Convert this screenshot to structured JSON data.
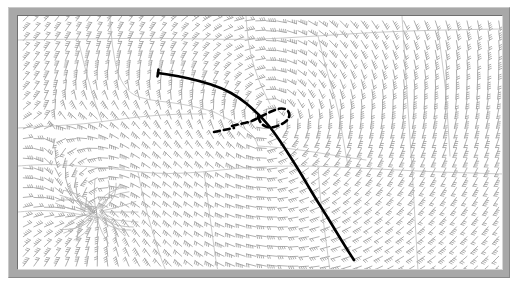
{
  "figure": {
    "title": "",
    "subtitle": "",
    "caption": "",
    "width_px": 518,
    "height_px": 296,
    "background_color": "#ffffff",
    "frame": {
      "name": "beveled-gray-frame",
      "outer_color": "#a8a8a8",
      "highlight_color": "#c9c9c9",
      "shadow_color": "#888888",
      "inner_border_color": "#6f6f6f",
      "plot_background": "#ffffff"
    }
  },
  "chart_data": {
    "type": "scatter",
    "title": "",
    "subtitle": "",
    "xlabel": "",
    "ylabel": "",
    "xlim": [
      0,
      486
    ],
    "ylim": [
      0,
      255
    ],
    "grid": false,
    "legend": "none",
    "annotations": [],
    "tick_labels": {
      "x": [],
      "y": []
    },
    "series": [
      {
        "name": "wind-barb-field",
        "kind": "vector-field",
        "symbol": "wind-barb",
        "color": "#9a9a9a",
        "grid_nx": 46,
        "grid_ny": 26,
        "barb_length_px": 9.5,
        "notes": "Light gray wind barbs on a regular lattice; direction rotates from westerly in the upper-left, through cyclonic turning around the central loop, to strong northerly/southerly flow on the right half."
      },
      {
        "name": "geographic-boundaries",
        "kind": "polyline-set",
        "color": "#b4b4b4",
        "width_px": 0.7,
        "polylines": [
          [
            [
              0,
              24
            ],
            [
              60,
              23
            ],
            [
              140,
              22
            ],
            [
              230,
              24
            ],
            [
              300,
              20
            ],
            [
              360,
              16
            ],
            [
              420,
              14
            ],
            [
              486,
              13
            ]
          ],
          [
            [
              92,
              0
            ],
            [
              94,
              30
            ],
            [
              100,
              60
            ],
            [
              112,
              78
            ],
            [
              130,
              84
            ],
            [
              150,
              86
            ],
            [
              175,
              90
            ],
            [
              196,
              96
            ]
          ],
          [
            [
              196,
              96
            ],
            [
              212,
              104
            ],
            [
              226,
              112
            ],
            [
              236,
              120
            ],
            [
              240,
              130
            ]
          ],
          [
            [
              0,
              112
            ],
            [
              34,
              110
            ],
            [
              66,
              108
            ],
            [
              96,
              104
            ],
            [
              128,
              100
            ],
            [
              160,
              98
            ],
            [
              188,
              98
            ]
          ],
          [
            [
              0,
              150
            ],
            [
              30,
              148
            ],
            [
              60,
              150
            ],
            [
              92,
              152
            ],
            [
              120,
              156
            ],
            [
              150,
              158
            ],
            [
              186,
              156
            ],
            [
              220,
              152
            ],
            [
              258,
              150
            ],
            [
              300,
              150
            ],
            [
              340,
              152
            ],
            [
              380,
              154
            ],
            [
              420,
              156
            ],
            [
              486,
              158
            ]
          ],
          [
            [
              120,
              156
            ],
            [
              126,
              186
            ],
            [
              134,
              214
            ],
            [
              142,
              240
            ],
            [
              148,
              255
            ]
          ],
          [
            [
              228,
              0
            ],
            [
              230,
              26
            ],
            [
              236,
              52
            ],
            [
              244,
              72
            ],
            [
              252,
              88
            ]
          ],
          [
            [
              300,
              20
            ],
            [
              306,
              44
            ],
            [
              312,
              66
            ],
            [
              318,
              86
            ],
            [
              322,
              104
            ],
            [
              326,
              128
            ],
            [
              330,
              150
            ]
          ],
          [
            [
              384,
              0
            ],
            [
              386,
              30
            ],
            [
              388,
              60
            ],
            [
              390,
              92
            ],
            [
              392,
              122
            ],
            [
              394,
              152
            ],
            [
              396,
              186
            ],
            [
              398,
              220
            ],
            [
              400,
              255
            ]
          ],
          [
            [
              300,
              150
            ],
            [
              302,
              180
            ],
            [
              306,
              210
            ],
            [
              310,
              240
            ],
            [
              312,
              255
            ]
          ],
          [
            [
              0,
              196
            ],
            [
              24,
              194
            ],
            [
              48,
              196
            ],
            [
              70,
              200
            ],
            [
              96,
              204
            ],
            [
              120,
              206
            ]
          ],
          [
            [
              240,
              130
            ],
            [
              268,
              132
            ],
            [
              296,
              136
            ],
            [
              320,
              140
            ],
            [
              348,
              144
            ]
          ],
          [
            [
              60,
              23
            ],
            [
              66,
              48
            ],
            [
              72,
              70
            ],
            [
              78,
              90
            ],
            [
              84,
              106
            ]
          ],
          [
            [
              420,
              14
            ],
            [
              424,
              44
            ],
            [
              428,
              76
            ],
            [
              430,
              108
            ],
            [
              432,
              140
            ]
          ],
          [
            [
              186,
              156
            ],
            [
              190,
              186
            ],
            [
              194,
              216
            ],
            [
              198,
              246
            ],
            [
              200,
              255
            ]
          ]
        ]
      },
      {
        "name": "primary-trough-axis",
        "kind": "curve",
        "style": "solid",
        "color": "#000000",
        "width_px": 2.6,
        "start_marker": "short-tick",
        "points": [
          [
            140,
            57
          ],
          [
            160,
            60
          ],
          [
            182,
            65
          ],
          [
            204,
            72
          ],
          [
            222,
            82
          ],
          [
            236,
            94
          ],
          [
            246,
            104
          ],
          [
            256,
            116
          ],
          [
            268,
            134
          ],
          [
            282,
            156
          ],
          [
            296,
            180
          ],
          [
            310,
            202
          ],
          [
            322,
            222
          ],
          [
            332,
            238
          ],
          [
            336,
            244
          ]
        ]
      },
      {
        "name": "secondary-dashed-axis",
        "kind": "curve",
        "style": "dashed",
        "color": "#000000",
        "width_px": 2.6,
        "dash_pattern": "6 4",
        "points": [
          [
            214,
            110
          ],
          [
            222,
            108
          ],
          [
            232,
            106
          ],
          [
            240,
            102
          ],
          [
            248,
            98
          ],
          [
            256,
            94
          ],
          [
            264,
            92
          ],
          [
            270,
            94
          ],
          [
            272,
            100
          ],
          [
            268,
            106
          ],
          [
            260,
            110
          ],
          [
            252,
            112
          ],
          [
            246,
            110
          ],
          [
            242,
            106
          ],
          [
            240,
            100
          ]
        ]
      },
      {
        "name": "dashed-axis-tail",
        "kind": "curve",
        "style": "dashed",
        "color": "#000000",
        "width_px": 2.6,
        "dash_pattern": "6 4",
        "points": [
          [
            196,
            116
          ],
          [
            206,
            114
          ],
          [
            216,
            112
          ]
        ]
      },
      {
        "name": "convergence-singularity",
        "kind": "point-feature",
        "symbol": "radiating-streamlines",
        "color": "#b0b0b0",
        "center": [
          78,
          196
        ],
        "radius_px": 42
      }
    ]
  },
  "accessibility": {
    "alt_text": "Gray-framed meteorological chart showing a dense field of light gray wind barbs, faint geographic boundary lines, a bold solid curve running from upper-left to lower-right, and a small dashed loop near the center."
  }
}
